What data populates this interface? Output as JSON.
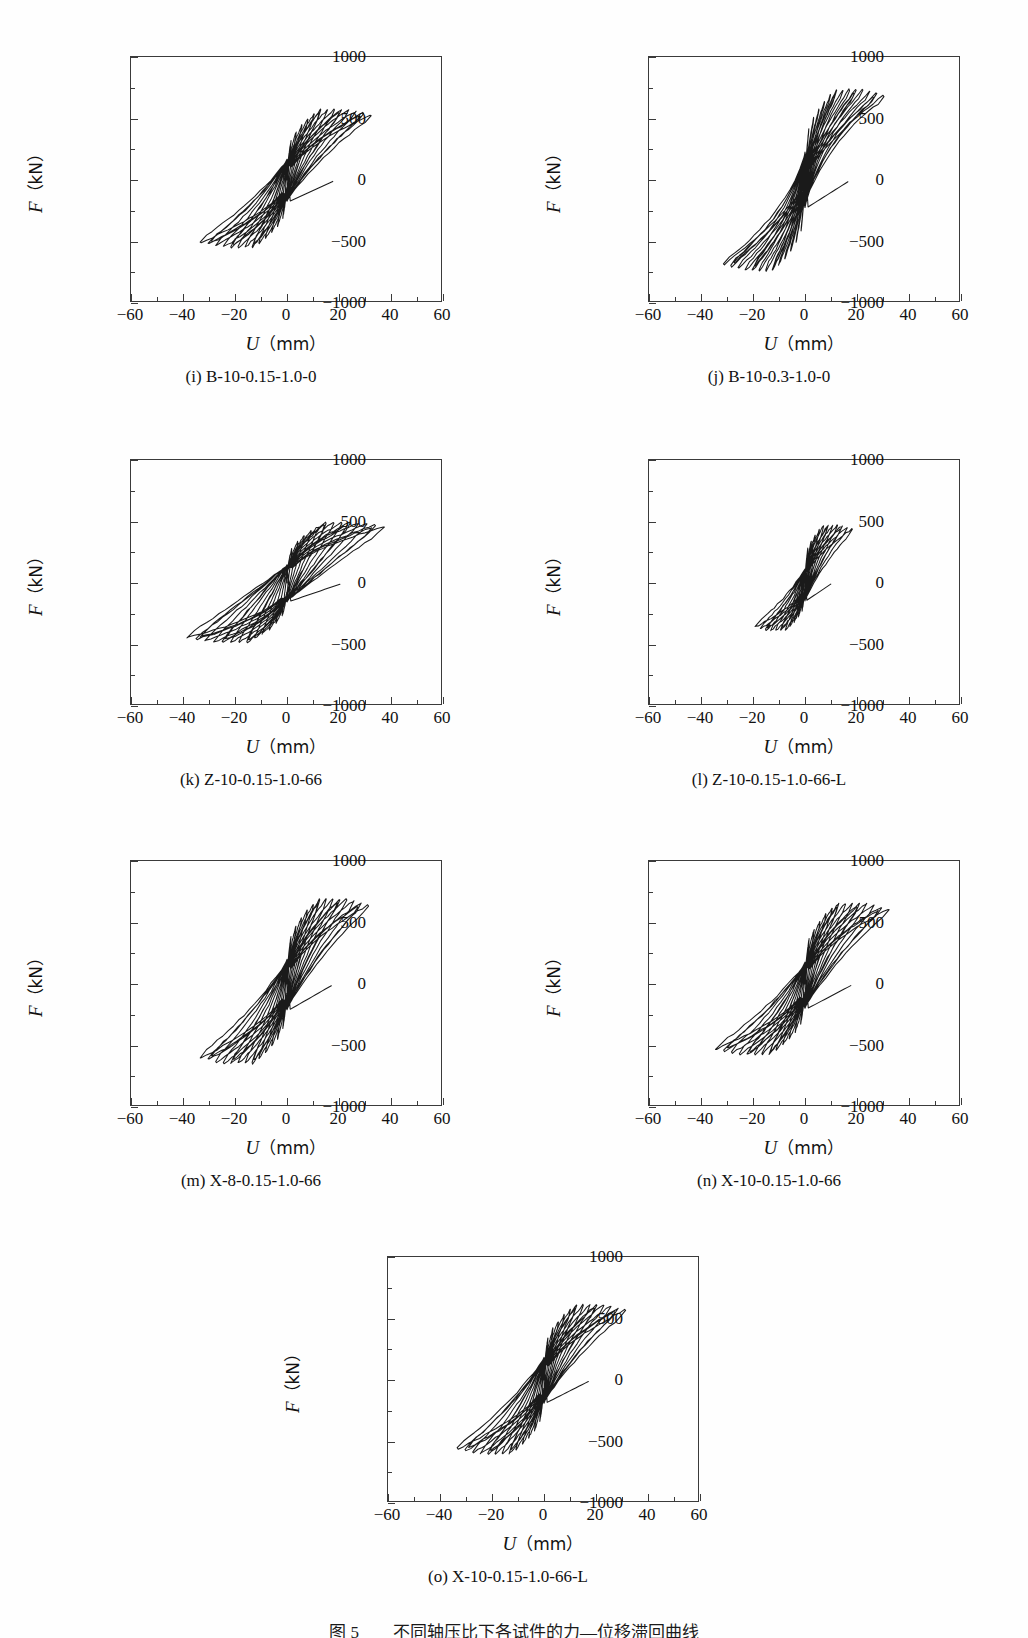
{
  "figure": {
    "caption": "图 5　　不同轴压比下各试件的力—位移滞回曲线"
  },
  "axes": {
    "x_title_symbol": "U",
    "x_title_unit": "（mm）",
    "y_title_symbol": "F",
    "y_title_unit": "（kN）",
    "x_ticks": [
      "-60",
      "-40",
      "-20",
      "0",
      "20",
      "40",
      "60"
    ],
    "y_ticks": [
      "1000",
      "500",
      "0",
      "-500",
      "-1000"
    ],
    "xlim": [
      -60,
      60
    ],
    "ylim": [
      -1000,
      1000
    ],
    "x_major_step": 20,
    "x_minor_step": 10,
    "y_major_step": 500,
    "y_minor_step": 250
  },
  "chart_data": {
    "type": "line",
    "title": "图 5　　不同轴压比下各试件的力—位移滞回曲线",
    "xlabel": "U（mm）",
    "ylabel": "F（kN）",
    "xlim": [
      -60,
      60
    ],
    "ylim": [
      -1000,
      1000
    ],
    "grid": false,
    "legend": "none",
    "panels": [
      {
        "key": "i",
        "label": "(i) B-10-0.15-1.0-0",
        "specimen": "B-10-0.15-1.0-0",
        "peak_force_positive": 570,
        "peak_force_negative": -545,
        "peak_disp_positive": 32,
        "peak_disp_negative": -33,
        "cycles": 13,
        "pinching": "moderate",
        "shape": "S-shaped pinched loops with long flat plateaus near ±500 kN"
      },
      {
        "key": "j",
        "label": "(j) B-10-0.3-1.0-0",
        "specimen": "B-10-0.3-1.0-0",
        "peak_force_positive": 735,
        "peak_force_negative": -735,
        "peak_disp_positive": 30,
        "peak_disp_negative": -31,
        "cycles": 13,
        "pinching": "slight",
        "shape": "Steep narrow spindle loops, highest strength of the set"
      },
      {
        "key": "k",
        "label": "(k) Z-10-0.15-1.0-66",
        "specimen": "Z-10-0.15-1.0-66",
        "peak_force_positive": 490,
        "peak_force_negative": -480,
        "peak_disp_positive": 37,
        "peak_disp_negative": -38,
        "cycles": 13,
        "pinching": "strong",
        "shape": "Flat wide loops with severe pinching and long displacement range"
      },
      {
        "key": "l",
        "label": "(l) Z-10-0.15-1.0-66-L",
        "specimen": "Z-10-0.15-1.0-66-L",
        "peak_force_positive": 470,
        "peak_force_negative": -385,
        "peak_disp_positive": 18,
        "peak_disp_negative": -19,
        "cycles": 11,
        "pinching": "moderate",
        "shape": "Small compact loops, early termination at about ±18 mm"
      },
      {
        "key": "m",
        "label": "(m) X-8-0.15-1.0-66",
        "specimen": "X-8-0.15-1.0-66",
        "peak_force_positive": 690,
        "peak_force_negative": -645,
        "peak_disp_positive": 31,
        "peak_disp_negative": -33,
        "cycles": 13,
        "pinching": "moderate",
        "shape": "Full S-shaped loops with broad energy dissipation area"
      },
      {
        "key": "n",
        "label": "(n) X-10-0.15-1.0-66",
        "specimen": "X-10-0.15-1.0-66",
        "peak_force_positive": 655,
        "peak_force_negative": -570,
        "peak_disp_positive": 32,
        "peak_disp_negative": -34,
        "cycles": 13,
        "pinching": "moderate",
        "shape": "Plump S-shaped loops similar to panel (m) with slightly lower negative peak"
      },
      {
        "key": "o",
        "label": "(o) X-10-0.15-1.0-66-L",
        "specimen": "X-10-0.15-1.0-66-L",
        "peak_force_positive": 610,
        "peak_force_negative": -600,
        "peak_disp_positive": 31,
        "peak_disp_negative": -33,
        "cycles": 13,
        "pinching": "moderate",
        "shape": "S-shaped loops with pronounced pinching at the origin"
      }
    ]
  },
  "panels": [
    {
      "id": "i",
      "caption": "(i) B-10-0.15-1.0-0"
    },
    {
      "id": "j",
      "caption": "(j) B-10-0.3-1.0-0"
    },
    {
      "id": "k",
      "caption": "(k) Z-10-0.15-1.0-66"
    },
    {
      "id": "l",
      "caption": "(l) Z-10-0.15-1.0-66-L"
    },
    {
      "id": "m",
      "caption": "(m) X-8-0.15-1.0-66"
    },
    {
      "id": "n",
      "caption": "(n) X-10-0.15-1.0-66"
    },
    {
      "id": "o",
      "caption": "(o) X-10-0.15-1.0-66-L"
    }
  ]
}
